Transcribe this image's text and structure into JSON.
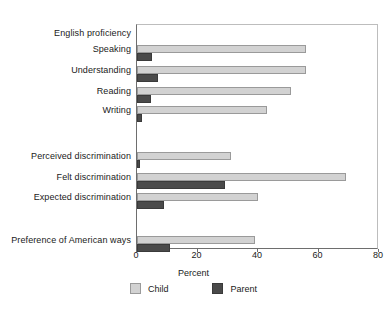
{
  "chart_data": {
    "type": "bar",
    "orientation": "horizontal",
    "title": "",
    "xlabel": "Percent",
    "ylabel": "",
    "xlim": [
      0,
      80
    ],
    "xticks": [
      0,
      20,
      40,
      60,
      80
    ],
    "grid": false,
    "legend_position": "bottom",
    "series": [
      {
        "name": "Child",
        "color": "#d2d2d2"
      },
      {
        "name": "Parent",
        "color": "#4a4a4a"
      }
    ],
    "groups": [
      {
        "header": "English proficiency",
        "categories": [
          {
            "label": "Speaking",
            "child": 56,
            "parent": 5
          },
          {
            "label": "Understanding",
            "child": 56,
            "parent": 7
          },
          {
            "label": "Reading",
            "child": 51,
            "parent": 4.5
          },
          {
            "label": "Writing",
            "child": 43,
            "parent": 1.5
          }
        ]
      },
      {
        "header": "",
        "categories": [
          {
            "label": "Perceived discrimination",
            "child": 31,
            "parent": 1
          },
          {
            "label": "Felt discrimination",
            "child": 69,
            "parent": 29
          },
          {
            "label": "Expected discrimination",
            "child": 40,
            "parent": 9
          }
        ]
      },
      {
        "header": "",
        "categories": [
          {
            "label": "Preference of American ways",
            "child": 39,
            "parent": 11
          }
        ]
      }
    ],
    "rows": [
      {
        "label": "English proficiency",
        "type": "header",
        "y": 33
      },
      {
        "label": "Speaking",
        "type": "data",
        "y": 49,
        "child": 56,
        "parent": 5
      },
      {
        "label": "Understanding",
        "type": "data",
        "y": 70,
        "child": 56,
        "parent": 7
      },
      {
        "label": "Reading",
        "type": "data",
        "y": 91,
        "child": 51,
        "parent": 4.5
      },
      {
        "label": "Writing",
        "type": "data",
        "y": 110,
        "child": 43,
        "parent": 1.5
      },
      {
        "label": "Perceived discrimination",
        "type": "data",
        "y": 156,
        "child": 31,
        "parent": 1
      },
      {
        "label": "Felt discrimination",
        "type": "data",
        "y": 177,
        "child": 69,
        "parent": 29
      },
      {
        "label": "Expected discrimination",
        "type": "data",
        "y": 197,
        "child": 40,
        "parent": 9
      },
      {
        "label": "Preference of American ways",
        "type": "data",
        "y": 240,
        "child": 39,
        "parent": 11
      }
    ]
  },
  "axis": {
    "tick_labels": [
      "0",
      "20",
      "40",
      "60",
      "80"
    ],
    "xlabel": "Percent"
  },
  "legend": {
    "child_label": "Child",
    "parent_label": "Parent"
  }
}
